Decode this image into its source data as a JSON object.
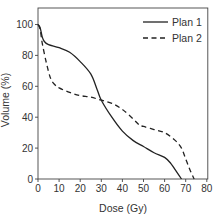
{
  "chart_data": {
    "type": "line",
    "title": "",
    "xlabel": "Dose (Gy)",
    "ylabel": "Volume (%)",
    "xlim": [
      0,
      80
    ],
    "ylim": [
      0,
      110
    ],
    "xticks": [
      0,
      10,
      20,
      30,
      40,
      50,
      60,
      70,
      80
    ],
    "yticks": [
      0,
      20,
      40,
      60,
      80,
      100
    ],
    "grid": false,
    "legend_position": "upper right",
    "series": [
      {
        "name": "Plan 1",
        "style": "solid",
        "color": "#222222",
        "x": [
          0,
          1,
          2,
          3,
          5,
          10,
          15,
          20,
          25,
          28,
          30,
          35,
          40,
          45,
          50,
          55,
          60,
          63,
          65,
          67,
          68
        ],
        "y": [
          100,
          98,
          92,
          89,
          87,
          85,
          82,
          76,
          68,
          58,
          51,
          40,
          31,
          25,
          21,
          17,
          14,
          10,
          6,
          2,
          0
        ]
      },
      {
        "name": "Plan 2",
        "style": "dashed",
        "color": "#222222",
        "x": [
          0,
          1,
          2,
          4,
          6,
          8,
          10,
          15,
          20,
          25,
          30,
          35,
          40,
          45,
          48,
          50,
          55,
          60,
          65,
          68,
          70,
          72,
          74
        ],
        "y": [
          100,
          97,
          88,
          75,
          65,
          61,
          59,
          56,
          54,
          53,
          51,
          49,
          45,
          39,
          35,
          34,
          32,
          30,
          25,
          20,
          13,
          6,
          0
        ]
      }
    ]
  }
}
